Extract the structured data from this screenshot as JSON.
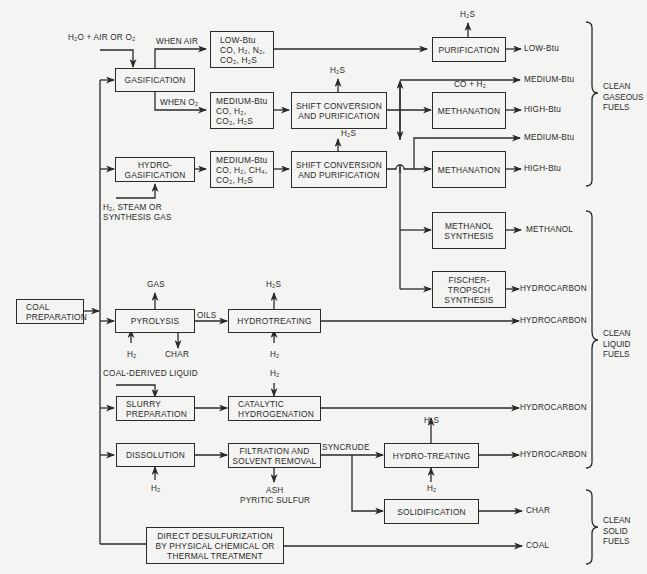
{
  "source": {
    "label": "COAL PREPARATION",
    "lines": [
      "COAL",
      "PREPARATION"
    ]
  },
  "inputs": {
    "gasification_feed": "H₂O + AIR OR O₂",
    "when_air": "WHEN AIR",
    "when_o2": "WHEN O₂",
    "hydrogasification_feed": [
      "H₂, STEAM OR",
      "SYNTHESIS GAS"
    ],
    "coal_derived_liquid": "COAL-DERIVED LIQUID",
    "oils": "OILS",
    "syncrude": "SYNCRUDE",
    "co_h2": "CO + H₂"
  },
  "boxes": {
    "gasification": [
      "GASIFICATION"
    ],
    "hydrogasification": [
      "HYDRO-",
      "GASIFICATION"
    ],
    "low_btu_gas": [
      "LOW-Btu",
      "CO, H₂, N₂,",
      "CO₂, H₂S"
    ],
    "medium_btu_gas_1": [
      "MEDIUM-Btu",
      "CO, H₂,",
      "CO₂, H₂S"
    ],
    "medium_btu_gas_2": [
      "MEDIUM-Btu",
      "CO, H₂, CH₄,",
      "CO₂, H₂S"
    ],
    "shift_1": [
      "SHIFT CONVERSION",
      "AND PURIFICATION"
    ],
    "shift_2": [
      "SHIFT CONVERSION",
      "AND PURIFICATION"
    ],
    "purification": [
      "PURIFICATION"
    ],
    "methanation_1": [
      "METHANATION"
    ],
    "methanation_2": [
      "METHANATION"
    ],
    "methanol_synthesis": [
      "METHANOL",
      "SYNTHESIS"
    ],
    "fischer_tropsch": [
      "FISCHER-",
      "TROPSCH",
      "SYNTHESIS"
    ],
    "pyrolysis": [
      "PYROLYSIS"
    ],
    "hydrotreating": [
      "HYDROTREATING"
    ],
    "slurry_preparation": [
      "SLURRY",
      "PREPARATION"
    ],
    "catalytic_hydrogenation": [
      "CATALYTIC",
      "HYDROGENATION"
    ],
    "dissolution": [
      "DISSOLUTION"
    ],
    "filtration": [
      "FILTRATION AND",
      "SOLVENT REMOVAL"
    ],
    "hydro_treating_2": [
      "HYDRO-TREATING"
    ],
    "solidification": [
      "SOLIDIFICATION"
    ],
    "direct_desulfurization": [
      "DIRECT DESULFURIZATION",
      "BY PHYSICAL CHEMICAL OR",
      "THERMAL TREATMENT"
    ]
  },
  "side_streams": {
    "h2s": "H₂S",
    "h2": "H₂",
    "gas": "GAS",
    "char": "CHAR",
    "ash": "ASH",
    "pyritic_sulfur": "PYRITIC SULFUR"
  },
  "products": {
    "low_btu": "LOW-Btu",
    "medium_btu_1": "MEDIUM-Btu",
    "high_btu_1": "HIGH-Btu",
    "medium_btu_2": "MEDIUM-Btu",
    "high_btu_2": "HIGH-Btu",
    "methanol": "METHANOL",
    "hydrocarbon_ft": "HYDROCARBON",
    "hydrocarbon_pyrolysis": "HYDROCARBON",
    "hydrocarbon_catalytic": "HYDROCARBON",
    "hydrocarbon_syncrude": "HYDROCARBON",
    "char": "CHAR",
    "coal": "COAL"
  },
  "categories": {
    "gaseous": [
      "CLEAN",
      "GASEOUS",
      "FUELS"
    ],
    "liquid": [
      "CLEAN",
      "LIQUID",
      "FUELS"
    ],
    "solid": [
      "CLEAN",
      "SOLID",
      "FUELS"
    ]
  },
  "colors": {
    "ink": "#2a2a2a",
    "paper": "#f4f4f2"
  }
}
